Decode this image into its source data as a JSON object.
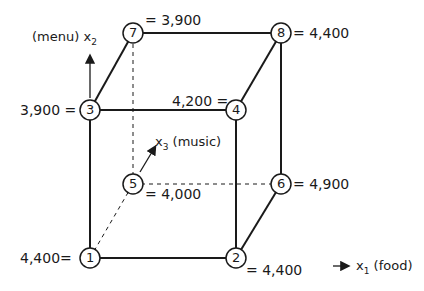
{
  "axes": {
    "x1": {
      "symbol": "x",
      "sub": "1",
      "name": "(food)"
    },
    "x2": {
      "symbol": "x",
      "sub": "2",
      "name": "(menu)"
    },
    "x3": {
      "symbol": "x",
      "sub": "3",
      "name": "(music)"
    }
  },
  "nodes": [
    {
      "id": "1",
      "value": "4,400="
    },
    {
      "id": "2",
      "value": "= 4,400"
    },
    {
      "id": "3",
      "value": "3,900 ="
    },
    {
      "id": "4",
      "value": "4,200 ="
    },
    {
      "id": "5",
      "value": "= 4,000"
    },
    {
      "id": "6",
      "value": "= 4,900"
    },
    {
      "id": "7",
      "value": "= 3,900"
    },
    {
      "id": "8",
      "value": "= 4,400"
    }
  ]
}
